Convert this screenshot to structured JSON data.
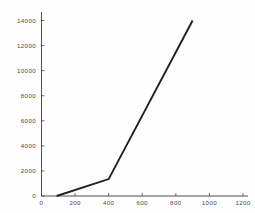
{
  "chart_data": {
    "type": "line",
    "title": "",
    "subtitle": "",
    "xlabel": "",
    "ylabel": "",
    "xlim": [
      0,
      1230
    ],
    "ylim": [
      0,
      14600
    ],
    "grid": false,
    "legend": false,
    "legend_position": "none",
    "xticks": [
      0,
      200,
      400,
      600,
      800,
      1000,
      1200
    ],
    "xtick_labels": [
      "0",
      "200",
      "400",
      "600",
      "800",
      "1000",
      "1200"
    ],
    "yticks": [
      0,
      2000,
      4000,
      6000,
      8000,
      10000,
      12000,
      14000
    ],
    "ytick_labels": [
      "0",
      "2000",
      "4000",
      "6000",
      "8000",
      "10000",
      "12000",
      "14000"
    ],
    "series": [
      {
        "name": "series-1",
        "color": "#1f1f1f",
        "line_width": 1.9,
        "x": [
          90,
          400,
          900
        ],
        "values": [
          0,
          1350,
          14000
        ]
      }
    ],
    "annotations": []
  },
  "axes": {
    "x_axis_name": "x-axis",
    "y_axis_name": "y-axis"
  },
  "colors": {
    "background": "#fefefe",
    "axis": "#3d3d3d",
    "tick_text": "#4a4a4a",
    "series": "#1f1f1f"
  }
}
